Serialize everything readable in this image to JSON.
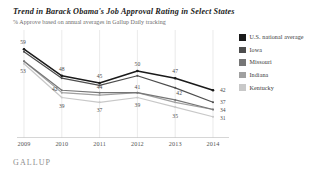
{
  "header": {
    "title": "Trend in Barack Obama's Job Approval Rating in Select States",
    "subtitle": "% Approve based on annual averages in Gallup Daily tracking"
  },
  "brand": {
    "name": "GALLUP"
  },
  "legend": {
    "position": "right",
    "items": [
      {
        "label": "U.S. national average",
        "color": "#1a1a1a"
      },
      {
        "label": "Iowa",
        "color": "#4d4d4d"
      },
      {
        "label": "Missouri",
        "color": "#767676"
      },
      {
        "label": "Indiana",
        "color": "#a0a0a0"
      },
      {
        "label": "Kentucky",
        "color": "#c8c8c8"
      }
    ]
  },
  "chart_data": {
    "type": "line",
    "title": "Trend in Barack Obama's Job Approval Rating in Select States",
    "subtitle": "% Approve based on annual averages in Gallup Daily tracking",
    "xlabel": "",
    "ylabel": "",
    "grid": "vertical",
    "ylim": [
      28,
      62
    ],
    "categories": [
      "2009",
      "2010",
      "2011",
      "2012",
      "2013",
      "2014"
    ],
    "series": [
      {
        "name": "U.S. national average",
        "color": "#1a1a1a",
        "values": [
          59,
          48,
          45,
          50,
          47,
          42
        ]
      },
      {
        "name": "Iowa",
        "color": "#4d4d4d",
        "values": [
          58,
          47,
          44,
          48,
          43,
          37
        ]
      },
      {
        "name": "Missouri",
        "color": "#767676",
        "values": [
          54,
          42,
          41,
          41,
          38,
          34
        ]
      },
      {
        "name": "Indiana",
        "color": "#a0a0a0",
        "values": [
          54,
          41,
          40,
          41,
          37,
          34
        ]
      },
      {
        "name": "Kentucky",
        "color": "#c8c8c8",
        "values": [
          53,
          39,
          37,
          39,
          35,
          31
        ]
      }
    ],
    "point_labels": [
      {
        "text": "59",
        "x": 0,
        "y": 59,
        "dx": -1,
        "dy": -5,
        "anchor": "middle"
      },
      {
        "text": "53",
        "x": 0,
        "y": 53,
        "dx": -1,
        "dy": 9,
        "anchor": "middle"
      },
      {
        "text": "48",
        "x": 1,
        "y": 48,
        "dx": 0,
        "dy": -5,
        "anchor": "middle"
      },
      {
        "text": "42",
        "x": 1,
        "y": 42,
        "dx": -7,
        "dy": 1,
        "anchor": "middle"
      },
      {
        "text": "39",
        "x": 1,
        "y": 39,
        "dx": 0,
        "dy": 11,
        "anchor": "middle"
      },
      {
        "text": "45",
        "x": 2,
        "y": 45,
        "dx": 0,
        "dy": -5,
        "anchor": "middle"
      },
      {
        "text": "44",
        "x": 2,
        "y": 41,
        "dx": 0,
        "dy": -4,
        "anchor": "middle"
      },
      {
        "text": "37",
        "x": 2,
        "y": 37,
        "dx": 0,
        "dy": 10,
        "anchor": "middle"
      },
      {
        "text": "50",
        "x": 3,
        "y": 50,
        "dx": 0,
        "dy": -5,
        "anchor": "middle"
      },
      {
        "text": "41",
        "x": 3,
        "y": 41,
        "dx": 0,
        "dy": -4,
        "anchor": "middle"
      },
      {
        "text": "39",
        "x": 3,
        "y": 39,
        "dx": 0,
        "dy": 10,
        "anchor": "middle"
      },
      {
        "text": "47",
        "x": 4,
        "y": 47,
        "dx": 0,
        "dy": -5,
        "anchor": "middle"
      },
      {
        "text": "42",
        "x": 4,
        "y": 43,
        "dx": 4,
        "dy": 7,
        "anchor": "middle"
      },
      {
        "text": "35",
        "x": 4,
        "y": 35,
        "dx": 0,
        "dy": 11,
        "anchor": "middle"
      },
      {
        "text": "42",
        "x": 5,
        "y": 42,
        "dx": 7,
        "dy": 2,
        "anchor": "start"
      },
      {
        "text": "37",
        "x": 5,
        "y": 37,
        "dx": 7,
        "dy": 2,
        "anchor": "start"
      },
      {
        "text": "34",
        "x": 5,
        "y": 34,
        "dx": 7,
        "dy": 2,
        "anchor": "start"
      },
      {
        "text": "31",
        "x": 5,
        "y": 31,
        "dx": 7,
        "dy": 3,
        "anchor": "start"
      }
    ]
  }
}
